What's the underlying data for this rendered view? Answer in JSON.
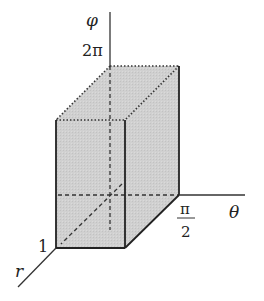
{
  "diagram": {
    "type": "3d-box-in-coordinate-space",
    "axes": {
      "vertical": {
        "label": "φ",
        "tick_label": "2π"
      },
      "right": {
        "label": "θ",
        "tick_label_numerator": "π",
        "tick_label_denominator": "2"
      },
      "diagonal": {
        "label": "r",
        "tick_label": "1"
      }
    },
    "box": {
      "fill_color": "#cfcfcf",
      "edge_color": "#222222",
      "hidden_edge_style": "dashed",
      "top_edge_style": "dotted"
    }
  }
}
